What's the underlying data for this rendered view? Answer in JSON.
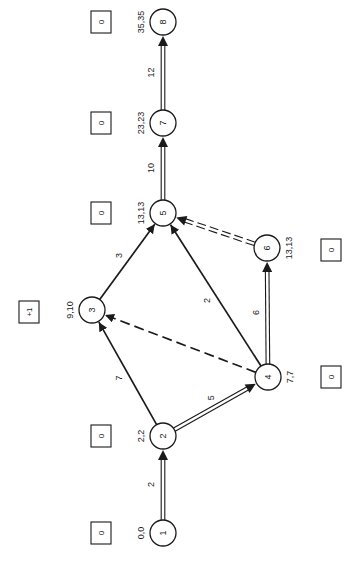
{
  "diagram": {
    "type": "activity-network (CPM), rotated 90° counter-clockwise",
    "colors": {
      "ink": "#1a1a1a",
      "background": "#ffffff"
    },
    "nodes": [
      {
        "id": "1",
        "label": "1",
        "times": "0,0",
        "x": 163,
        "y": 533,
        "float_box": "0",
        "box_x": 101,
        "box_y": 533
      },
      {
        "id": "2",
        "label": "2",
        "times": "2,2",
        "x": 163,
        "y": 436,
        "float_box": "0",
        "box_x": 101,
        "box_y": 436
      },
      {
        "id": "3",
        "label": "3",
        "times": "9,10",
        "x": 92,
        "y": 310,
        "float_box": "+1",
        "box_x": 29,
        "box_y": 312
      },
      {
        "id": "4",
        "label": "4",
        "times": "7,7",
        "x": 268,
        "y": 377,
        "float_box": "0",
        "box_x": 331,
        "box_y": 377
      },
      {
        "id": "5",
        "label": "5",
        "times": "13,13",
        "x": 163,
        "y": 213,
        "float_box": "0",
        "box_x": 101,
        "box_y": 213
      },
      {
        "id": "6",
        "label": "6",
        "times": "13,13",
        "x": 267,
        "y": 248,
        "float_box": "0",
        "box_x": 331,
        "box_y": 250
      },
      {
        "id": "7",
        "label": "7",
        "times": "23,23",
        "x": 163,
        "y": 123,
        "float_box": "0",
        "box_x": 101,
        "box_y": 123
      },
      {
        "id": "8",
        "label": "8",
        "times": "35,35",
        "x": 163,
        "y": 22,
        "float_box": "0",
        "box_x": 101,
        "box_y": 22
      }
    ],
    "edges": [
      {
        "from": "1",
        "to": "2",
        "duration": "2",
        "style": "double"
      },
      {
        "from": "2",
        "to": "3",
        "duration": "7",
        "style": "solid"
      },
      {
        "from": "2",
        "to": "4",
        "duration": "5",
        "style": "double"
      },
      {
        "from": "3",
        "to": "5",
        "duration": "3",
        "style": "solid"
      },
      {
        "from": "4",
        "to": "3",
        "duration": "",
        "style": "dashed"
      },
      {
        "from": "4",
        "to": "5",
        "duration": "2",
        "style": "solid"
      },
      {
        "from": "4",
        "to": "6",
        "duration": "6",
        "style": "double"
      },
      {
        "from": "6",
        "to": "5",
        "duration": "",
        "style": "double-dashed"
      },
      {
        "from": "5",
        "to": "7",
        "duration": "10",
        "style": "double"
      },
      {
        "from": "7",
        "to": "8",
        "duration": "12",
        "style": "double"
      }
    ]
  }
}
